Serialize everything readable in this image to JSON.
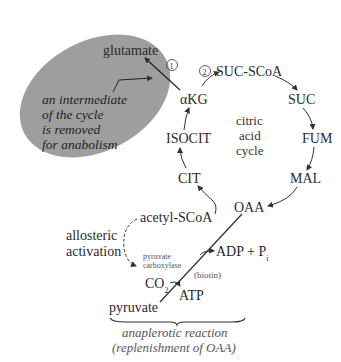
{
  "diagram": {
    "colors": {
      "ellipse_fill": "#9e9e9e",
      "line": "#333333",
      "text": "#2a2a2a",
      "background": "#ffffff"
    },
    "removal_note": {
      "line1": "an intermediate",
      "line2": "of the cycle",
      "line3": "is removed",
      "line4": "for anabolism"
    },
    "product": "glutamate",
    "step_markers": [
      "1",
      "2"
    ],
    "cycle_center": {
      "line1": "citric",
      "line2": "acid",
      "line3": "cycle"
    },
    "intermediates": {
      "akg": "αKG",
      "succoa": "SUC-SCoA",
      "suc": "SUC",
      "fum": "FUM",
      "mal": "MAL",
      "oaa": "OAA",
      "cit": "CIT",
      "isocit": "ISOCIT"
    },
    "acetyl": "acetyl-SCoA",
    "regulation": {
      "line1": "allosteric",
      "line2": "activation"
    },
    "enzyme": {
      "line1": "pyruvate",
      "line2": "carboxylase",
      "cofactor": "(biotin)"
    },
    "reactants": {
      "co2": "CO",
      "co2_sub": "2",
      "atp": "ATP",
      "adp": "ADP + P",
      "pi_sub": "i",
      "pyruvate": "pyruvate"
    },
    "caption": {
      "line1": "anaplerotic reaction",
      "line2": "(replenishment of OAA)"
    }
  }
}
